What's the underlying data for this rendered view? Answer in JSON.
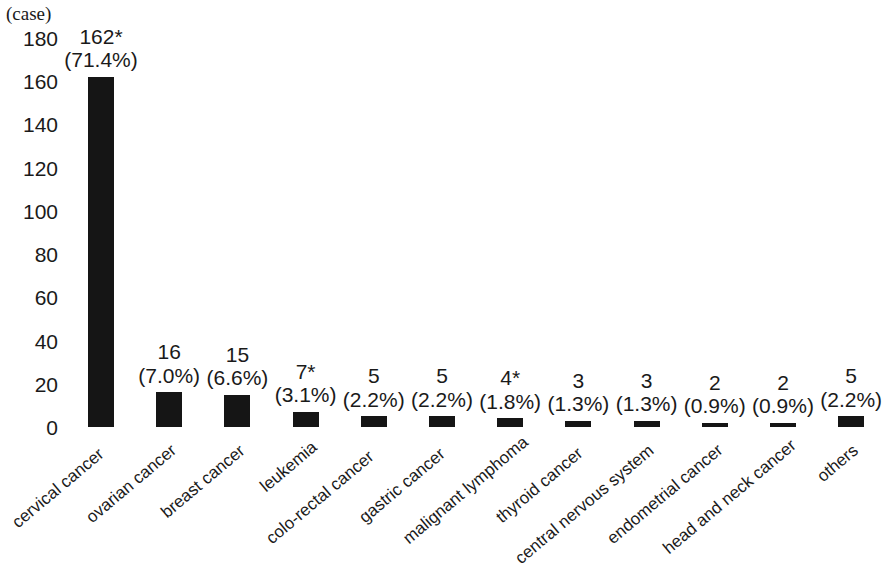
{
  "chart_data": {
    "type": "bar",
    "title": "",
    "subtitle": "",
    "xlabel": "",
    "ylabel": "(case)",
    "unit_caption": "(case)",
    "ylim": [
      0,
      180
    ],
    "yticks": [
      0,
      20,
      40,
      60,
      80,
      100,
      120,
      140,
      160,
      180
    ],
    "ytick_labels": [
      "0",
      "20",
      "40",
      "60",
      "80",
      "100",
      "120",
      "140",
      "160",
      "180"
    ],
    "grid": false,
    "legend": null,
    "bar_color": "#151515",
    "total_cases": 227,
    "categories": [
      "cervical cancer",
      "ovarian cancer",
      "breast cancer",
      "leukemia",
      "colo-rectal cancer",
      "gastric cancer",
      "malignant lymphoma",
      "thyroid cancer",
      "central nervous system",
      "endometrial cancer",
      "head and neck cancer",
      "others"
    ],
    "values": [
      162,
      16,
      15,
      7,
      5,
      5,
      4,
      3,
      3,
      2,
      2,
      5
    ],
    "percents": [
      "71.4%",
      "7.0%",
      "6.6%",
      "3.1%",
      "2.2%",
      "2.2%",
      "1.8%",
      "1.3%",
      "1.3%",
      "0.9%",
      "0.9%",
      "2.2%"
    ],
    "count_labels": [
      "162*",
      "16",
      "15",
      "7*",
      "5",
      "5",
      "4*",
      "3",
      "3",
      "2",
      "2",
      "5"
    ],
    "pct_labels": [
      "(71.4%)",
      "(7.0%)",
      "(6.6%)",
      "(3.1%)",
      "(2.2%)",
      "(2.2%)",
      "(1.8%)",
      "(1.3%)",
      "(1.3%)",
      "(0.9%)",
      "(0.9%)",
      "(2.2%)"
    ],
    "footnote_marker": "*",
    "annotations": [
      {
        "category": "cervical cancer",
        "note": "162*"
      },
      {
        "category": "leukemia",
        "note": "7*"
      },
      {
        "category": "malignant lymphoma",
        "note": "4*"
      }
    ]
  }
}
